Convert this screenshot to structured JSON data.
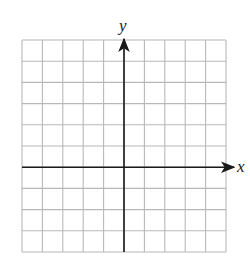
{
  "diagram": {
    "type": "coordinate-grid",
    "x_axis_label": "x",
    "y_axis_label": "y",
    "grid": {
      "columns": 10,
      "rows": 10,
      "left": 22,
      "top": 40,
      "right": 226,
      "bottom": 252,
      "y_axis_column_index": 5,
      "x_axis_row_index": 6
    },
    "colors": {
      "grid_line": "#b8b8b8",
      "axis": "#1a1a1a",
      "background": "#ffffff"
    }
  }
}
